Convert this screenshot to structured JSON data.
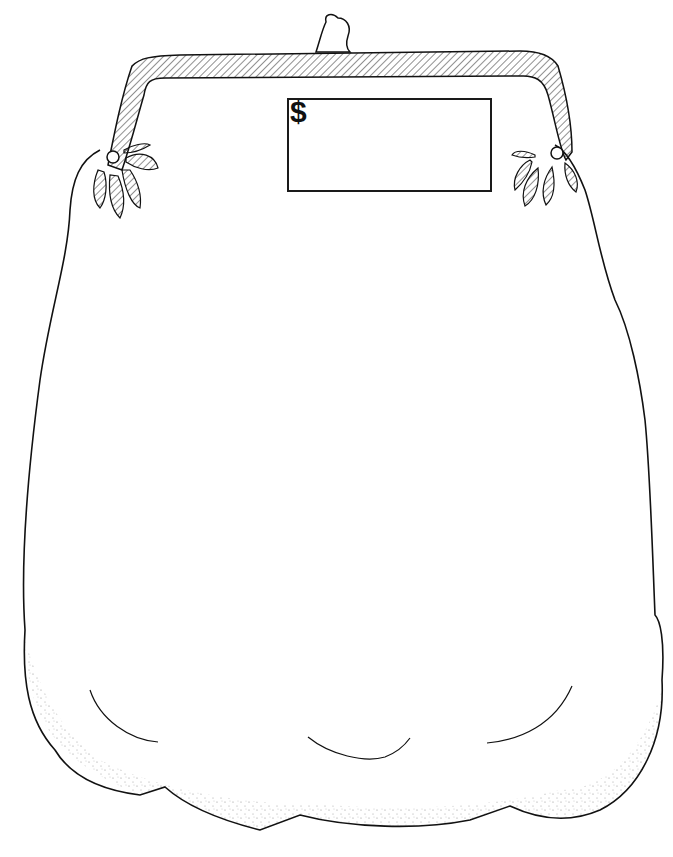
{
  "illustration": {
    "subject": "coin purse line drawing",
    "stroke_color": "#111111",
    "background_color": "#ffffff"
  },
  "price_tag": {
    "symbol": "$",
    "value": ""
  }
}
